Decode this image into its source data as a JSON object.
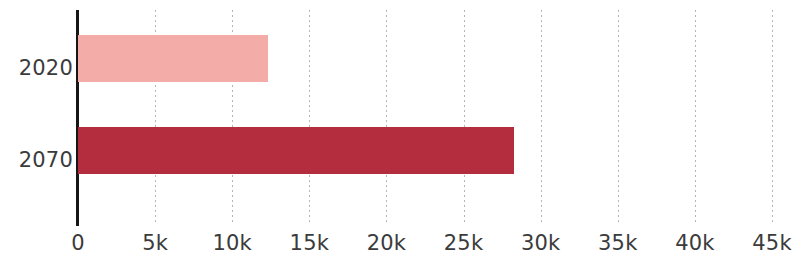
{
  "chart_data": {
    "type": "bar",
    "orientation": "horizontal",
    "title": "",
    "subtitle": "",
    "xlabel": "",
    "ylabel": "",
    "categories": [
      "2020",
      "2070"
    ],
    "values": [
      12300,
      28300
    ],
    "series": [
      {
        "name": "",
        "values": [
          12300,
          28300
        ],
        "colors": [
          "#f4aca8",
          "#b32d3e"
        ]
      }
    ],
    "bar_colors": {
      "2020": "#f4aca8",
      "2070": "#b32d3e"
    },
    "xlim": [
      0,
      45000
    ],
    "ylim": null,
    "x_ticks": [
      0,
      5000,
      10000,
      15000,
      20000,
      25000,
      30000,
      35000,
      40000,
      45000
    ],
    "x_tick_labels": [
      "0",
      "5k",
      "10k",
      "15k",
      "20k",
      "25k",
      "30k",
      "35k",
      "40k",
      "45k"
    ],
    "grid": {
      "x": true,
      "y": false,
      "style": "dotted",
      "color": "#b4b4b4"
    },
    "legend": {
      "visible": false,
      "position": "none",
      "entries": []
    },
    "annotations": [],
    "data_labels": false,
    "axis_line_color": "#161616",
    "background_color": "#ffffff",
    "tick_label_color": "#3b3b3b"
  }
}
